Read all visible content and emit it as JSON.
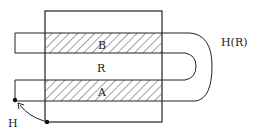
{
  "diagram": {
    "labels": {
      "strip_top": "B",
      "region": "R",
      "strip_bottom": "A",
      "point": "H",
      "loop": "H(R)"
    },
    "colors": {
      "stroke": "#222222",
      "background": "#ffffff"
    }
  }
}
